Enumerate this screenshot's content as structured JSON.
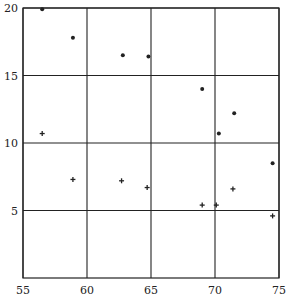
{
  "chart_data": {
    "type": "scatter",
    "title": "",
    "xlabel": "",
    "ylabel": "",
    "xlim": [
      55,
      75
    ],
    "ylim": [
      0,
      20
    ],
    "xticks": [
      55,
      60,
      65,
      70,
      75
    ],
    "yticks": [
      5,
      10,
      15,
      20
    ],
    "xtick_labels": [
      "55",
      "60",
      "65",
      "70",
      "75"
    ],
    "ytick_labels": [
      "5",
      "10",
      "15",
      "20"
    ],
    "grid": true,
    "legend": null,
    "series": [
      {
        "name": "dots",
        "marker": "dot",
        "points": [
          {
            "x": 56.5,
            "y": 19.9
          },
          {
            "x": 58.9,
            "y": 17.8
          },
          {
            "x": 62.8,
            "y": 16.5
          },
          {
            "x": 64.8,
            "y": 16.4
          },
          {
            "x": 69.0,
            "y": 14.0
          },
          {
            "x": 71.5,
            "y": 12.2
          },
          {
            "x": 70.3,
            "y": 10.7
          },
          {
            "x": 74.5,
            "y": 8.5
          }
        ]
      },
      {
        "name": "crosses",
        "marker": "plus",
        "points": [
          {
            "x": 56.5,
            "y": 10.7
          },
          {
            "x": 58.9,
            "y": 7.3
          },
          {
            "x": 62.7,
            "y": 7.2
          },
          {
            "x": 64.7,
            "y": 6.7
          },
          {
            "x": 69.0,
            "y": 5.4
          },
          {
            "x": 70.1,
            "y": 5.4
          },
          {
            "x": 71.4,
            "y": 6.6
          },
          {
            "x": 74.5,
            "y": 4.6
          }
        ]
      }
    ]
  },
  "colors": {
    "ink": "#222222",
    "background": "#ffffff"
  }
}
